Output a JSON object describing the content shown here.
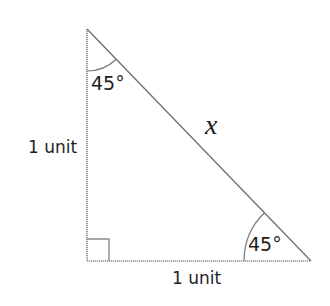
{
  "diagram": {
    "type": "right-isosceles-triangle",
    "colors": {
      "line": "#7a7a7a",
      "text": "#1e1e1e",
      "background": "#ffffff"
    },
    "vertices": {
      "top": [
        87,
        29
      ],
      "right_angle": [
        87,
        261
      ],
      "bottom_right": [
        311,
        261
      ]
    },
    "labels": {
      "top_angle": "45°",
      "bottom_right_angle": "45°",
      "left_side": "1 unit",
      "bottom_side": "1 unit",
      "hypotenuse": "x"
    }
  }
}
